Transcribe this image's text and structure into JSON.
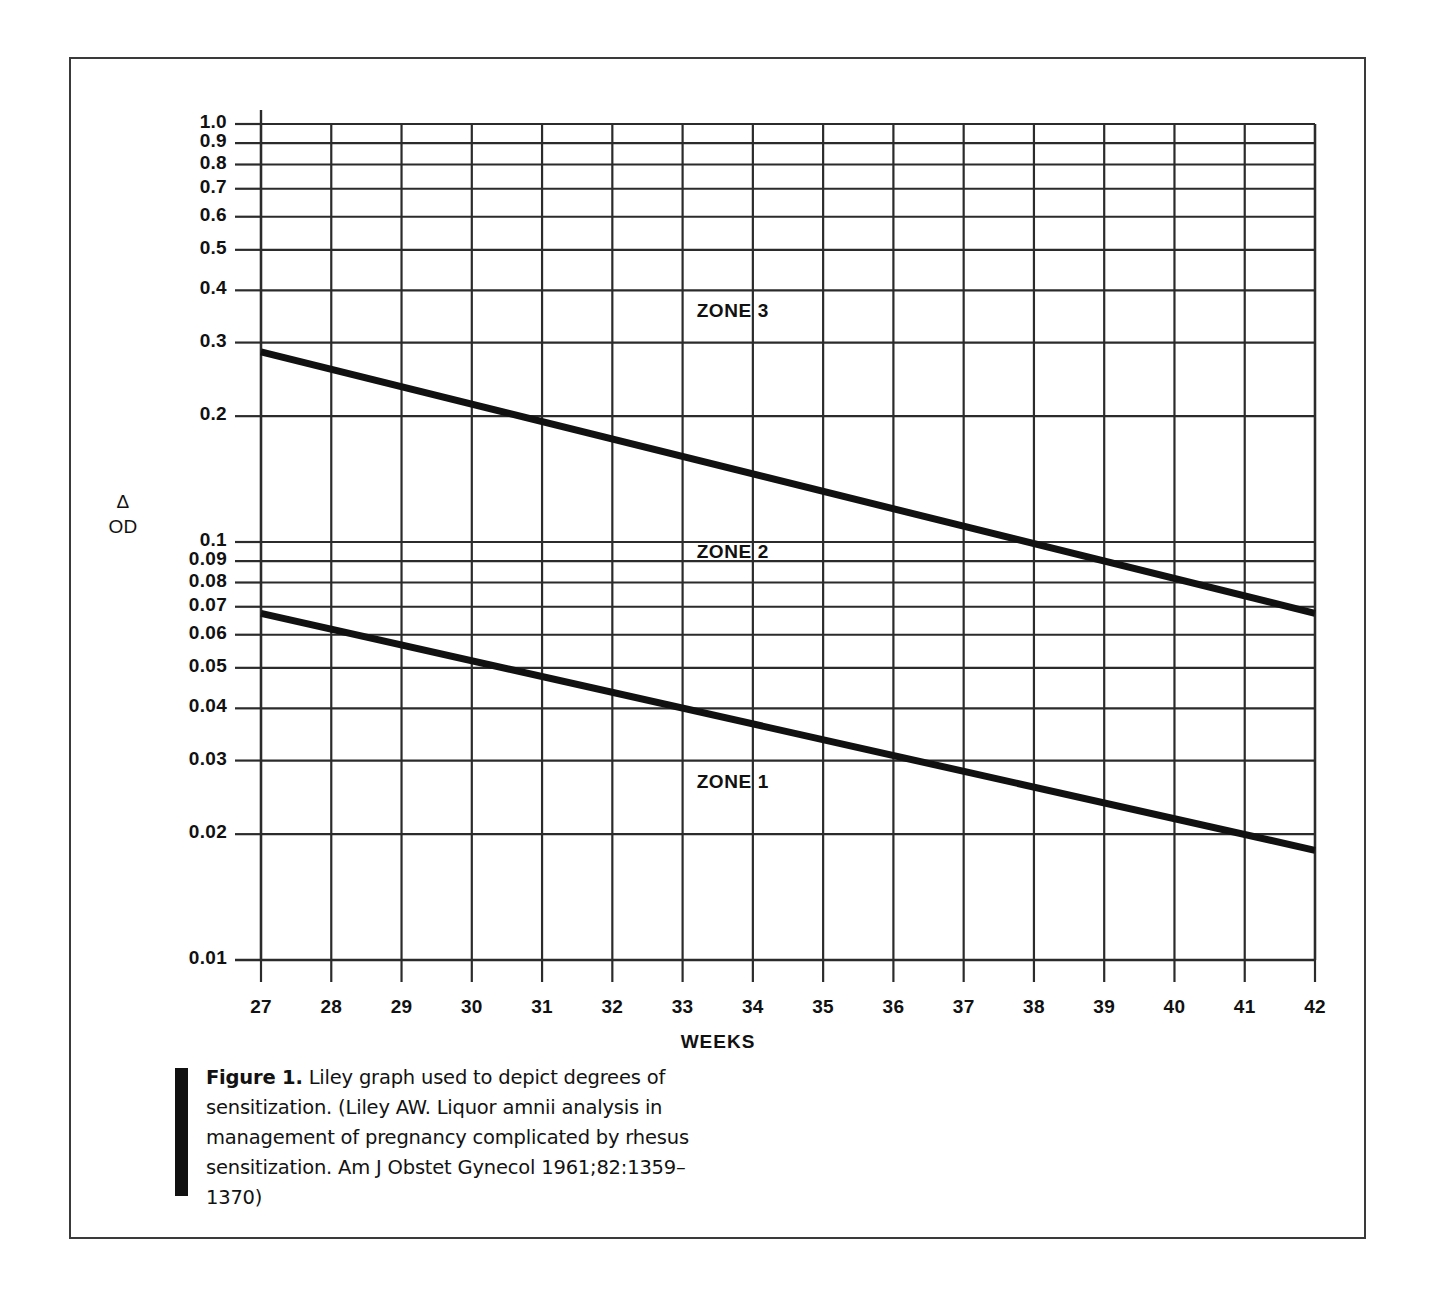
{
  "figure": {
    "caption_label": "Figure 1.",
    "caption_text": " Liley graph used to depict degrees of sensitization. (Liley AW. Liquor amnii analysis in management of pregnancy complicated by rhesus sensitization. Am J Obstet Gynecol 1961;82:1359–1370)"
  },
  "axes": {
    "y_axis_label_line1": "Δ",
    "y_axis_label_line2": "OD",
    "x_axis_title": "WEEKS"
  },
  "zones": [
    {
      "name": "zone-3",
      "label": "ZONE 3"
    },
    {
      "name": "zone-2",
      "label": "ZONE 2"
    },
    {
      "name": "zone-1",
      "label": "ZONE 1"
    }
  ],
  "chart_data": {
    "type": "line",
    "title": "Liley graph used to depict degrees of sensitization",
    "xlabel": "WEEKS",
    "ylabel": "Δ OD",
    "yscale": "log",
    "ylim": [
      0.01,
      1.0
    ],
    "xlim": [
      27,
      42
    ],
    "grid": true,
    "legend": "none",
    "x_ticks": [
      27,
      28,
      29,
      30,
      31,
      32,
      33,
      34,
      35,
      36,
      37,
      38,
      39,
      40,
      41,
      42
    ],
    "x_tick_labels": [
      "27",
      "28",
      "29",
      "30",
      "31",
      "32",
      "33",
      "34",
      "35",
      "36",
      "37",
      "38",
      "39",
      "40",
      "41",
      "42"
    ],
    "y_ticks": [
      0.01,
      0.02,
      0.03,
      0.04,
      0.05,
      0.06,
      0.07,
      0.08,
      0.09,
      0.1,
      0.2,
      0.3,
      0.4,
      0.5,
      0.6,
      0.7,
      0.8,
      0.9,
      1.0
    ],
    "y_tick_labels": [
      "0.01",
      "0.02",
      "0.03",
      "0.04",
      "0.05",
      "0.06",
      "0.07",
      "0.08",
      "0.09",
      "0.1",
      "0.2",
      "0.3",
      "0.4",
      "0.5",
      "0.6",
      "0.7",
      "0.8",
      "0.9",
      "1.0"
    ],
    "y_gridlines_drawn": [
      0.02,
      0.03,
      0.04,
      0.05,
      0.06,
      0.07,
      0.08,
      0.09,
      0.1,
      0.2,
      0.3,
      0.4,
      0.5,
      0.6,
      0.7,
      0.8,
      0.9,
      1.0
    ],
    "series": [
      {
        "name": "zone-2/zone-3 boundary (upper line)",
        "x": [
          27,
          42
        ],
        "y": [
          0.285,
          0.0675
        ]
      },
      {
        "name": "zone-1/zone-2 boundary (lower line)",
        "x": [
          27,
          42
        ],
        "y": [
          0.0675,
          0.0183
        ]
      }
    ],
    "annotations": [
      {
        "text": "ZONE 3",
        "x": 33.2,
        "y": 0.355
      },
      {
        "text": "ZONE 2",
        "x": 33.2,
        "y": 0.094
      },
      {
        "text": "ZONE 1",
        "x": 33.2,
        "y": 0.0265
      }
    ]
  }
}
